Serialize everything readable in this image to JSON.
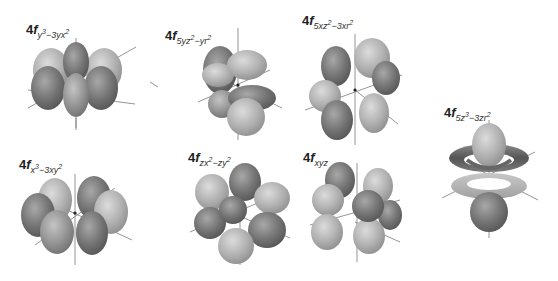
{
  "figure": {
    "colors": {
      "lobe_dark": "#6f6f6f",
      "lobe_mid": "#8e8e8e",
      "lobe_light": "#b4b4b4",
      "axis": "#7a7a7a",
      "background": "#ffffff",
      "label": "#222222"
    },
    "orbitals": [
      {
        "id": "y3-3yx2",
        "prefix": "4",
        "letter": "f",
        "subscript_parts": [
          "y",
          "3",
          "−3yx",
          "2"
        ],
        "label_text": "4f y³−3yx²",
        "position": "row1-col1"
      },
      {
        "id": "5yz2-yr2",
        "prefix": "4",
        "letter": "f",
        "subscript_parts": [
          "5yz",
          "2",
          "−yr",
          "2"
        ],
        "label_text": "4f 5yz²−yr²",
        "position": "row1-col2"
      },
      {
        "id": "5xz2-3xr2",
        "prefix": "4",
        "letter": "f",
        "subscript_parts": [
          "5xz",
          "2",
          "−3xr",
          "2"
        ],
        "label_text": "4f 5xz²−3xr²",
        "position": "row1-col3"
      },
      {
        "id": "5z3-3zr2",
        "prefix": "4",
        "letter": "f",
        "subscript_parts": [
          "5z",
          "3",
          "−3zr",
          "2"
        ],
        "label_text": "4f 5z³−3zr²",
        "position": "right"
      },
      {
        "id": "x3-3xy2",
        "prefix": "4",
        "letter": "f",
        "subscript_parts": [
          "x",
          "3",
          "−3xy",
          "2"
        ],
        "label_text": "4f x³−3xy²",
        "position": "row2-col1"
      },
      {
        "id": "zx2-zy2",
        "prefix": "4",
        "letter": "f",
        "subscript_parts": [
          "zx",
          "2",
          "−zy",
          "2"
        ],
        "label_text": "4f zx²−zy²",
        "position": "row2-col2"
      },
      {
        "id": "xyz",
        "prefix": "4",
        "letter": "f",
        "subscript_parts": [
          "xyz",
          "",
          "",
          ""
        ],
        "label_text": "4f xyz",
        "position": "row2-col3"
      }
    ]
  }
}
